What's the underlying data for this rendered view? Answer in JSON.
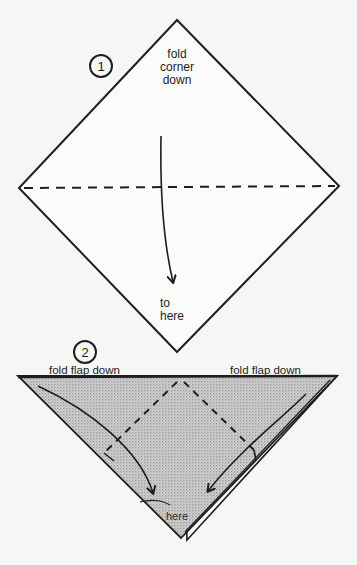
{
  "page": {
    "header_cutoff_text": "diagrams continued from previous page"
  },
  "step1": {
    "number": "1",
    "instruction_lines": [
      "fold",
      "corner",
      "down"
    ],
    "target_lines": [
      "to",
      "here"
    ],
    "shape": "square-diamond",
    "fold_line": "horizontal-valley-dashed"
  },
  "step2": {
    "number": "2",
    "left_instruction": "fold flap down",
    "right_instruction": "fold flap down",
    "target_label": "here",
    "shape": "triangle-pointing-down",
    "fill_color": "#c9c9c9",
    "fold_lines": "two-dashed-diagonals-forming-peak"
  },
  "colors": {
    "ink": "#1e1e1e",
    "paper_background": "#f6f6f4",
    "shaded_paper": "#c9c9c9"
  }
}
